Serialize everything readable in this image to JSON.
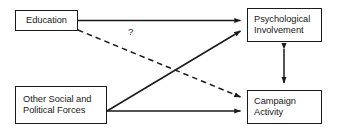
{
  "diagram": {
    "type": "path-diagram",
    "background_color": "#ffffff",
    "line_color": "#1a1a1a",
    "text_color": "#1a1a1a",
    "nodes": [
      {
        "id": "education",
        "lines": [
          "Education"
        ],
        "position": "top-left"
      },
      {
        "id": "other-forces",
        "lines": [
          "Other Social and",
          "Political Forces"
        ],
        "position": "bottom-left"
      },
      {
        "id": "psychological-involvement",
        "lines": [
          "Psychological",
          "Involvement"
        ],
        "position": "top-right"
      },
      {
        "id": "campaign-activity",
        "lines": [
          "Campaign",
          "Activity"
        ],
        "position": "bottom-right"
      }
    ],
    "edges": [
      {
        "id": "education-to-psychological-involvement",
        "from": "education",
        "to": "psychological-involvement",
        "style": "solid",
        "arrow": "single",
        "label": ""
      },
      {
        "id": "education-to-campaign-activity",
        "from": "education",
        "to": "campaign-activity",
        "style": "dashed",
        "arrow": "single",
        "label": "?"
      },
      {
        "id": "other-forces-to-psychological-involvement",
        "from": "other-forces",
        "to": "psychological-involvement",
        "style": "solid",
        "arrow": "single",
        "label": ""
      },
      {
        "id": "other-forces-to-campaign-activity",
        "from": "other-forces",
        "to": "campaign-activity",
        "style": "solid",
        "arrow": "single",
        "label": ""
      },
      {
        "id": "psychological-involvement-campaign-activity",
        "from": "psychological-involvement",
        "to": "campaign-activity",
        "style": "solid",
        "arrow": "double",
        "label": ""
      }
    ]
  }
}
